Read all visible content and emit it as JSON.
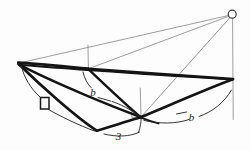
{
  "figure": {
    "type": "line-diagram",
    "background_color": "#fdfdfd",
    "heavy_stroke_color": "#141414",
    "light_stroke_color": "#8c8c8c",
    "leader_stroke_color": "#2a2a2a"
  },
  "labels": {
    "edge_b_left": "b",
    "edge_b_right": "b",
    "edge_three": "3",
    "right_angle_marker": "right-angle-square"
  },
  "vertices": {
    "apex": {
      "x": 232,
      "y": 14,
      "marker": "small-circle"
    },
    "left": {
      "x": 18,
      "y": 63
    },
    "mid_upper": {
      "x": 88,
      "y": 69
    },
    "right": {
      "x": 233,
      "y": 79
    },
    "center": {
      "x": 141,
      "y": 117
    },
    "bottom_left": {
      "x": 97,
      "y": 131
    },
    "ridge_top": {
      "x": 88,
      "y": 45
    },
    "foot_right": {
      "x": 233,
      "y": 119
    }
  },
  "edges": {
    "heavy": [
      {
        "name": "left-to-mid-upper",
        "from": "left",
        "to": "mid_upper"
      },
      {
        "name": "mid-upper-to-right",
        "from": "mid_upper",
        "to": "right"
      },
      {
        "name": "left-to-bottom-left",
        "from": "left",
        "to": "bottom_left"
      },
      {
        "name": "bottom-left-to-center",
        "from": "bottom_left",
        "to": "center"
      },
      {
        "name": "center-to-right",
        "from": "center",
        "to": "right"
      },
      {
        "name": "left-to-center",
        "from": "left",
        "to": "center"
      },
      {
        "name": "mid-upper-to-center",
        "from": "mid_upper",
        "to": "center"
      },
      {
        "name": "left-to-right-long",
        "from": "left",
        "to": "right"
      }
    ],
    "light": [
      {
        "name": "left-to-apex",
        "from": "left",
        "to": "apex"
      },
      {
        "name": "mid-upper-to-apex",
        "from": "mid_upper",
        "to": "apex"
      },
      {
        "name": "center-to-apex",
        "from": "center",
        "to": "apex"
      },
      {
        "name": "apex-vertical-drop",
        "from": "apex",
        "to": "foot_right"
      },
      {
        "name": "ridge-vertical",
        "from": "ridge_top",
        "to": "mid_upper"
      },
      {
        "name": "center-vertical",
        "from": "center_top",
        "to": "center"
      }
    ]
  },
  "leaders": [
    {
      "name": "leader-right-angle-upper",
      "target": "right_angle_marker"
    },
    {
      "name": "leader-right-angle-lower",
      "target": "right_angle_marker"
    },
    {
      "name": "leader-edge-b-left",
      "target": "edge_b_left"
    },
    {
      "name": "leader-edge-b-right",
      "target": "edge_b_right"
    },
    {
      "name": "leader-edge-three",
      "target": "edge_three"
    }
  ]
}
